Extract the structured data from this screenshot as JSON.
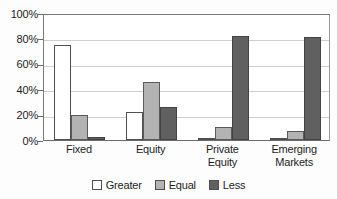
{
  "chart_data": {
    "type": "bar",
    "title": "",
    "subtitle": "",
    "xlabel": "",
    "ylabel": "",
    "categories": [
      "Fixed",
      "Equity",
      "Private Equity",
      "Emerging Markets"
    ],
    "category_lines": [
      [
        "Fixed"
      ],
      [
        "Equity"
      ],
      [
        "Private",
        "Equity"
      ],
      [
        "Emerging",
        "Markets"
      ]
    ],
    "series": [
      {
        "name": "Greater",
        "color": "#ffffff",
        "values": [
          75,
          22,
          1,
          1
        ]
      },
      {
        "name": "Equal",
        "color": "#b3b3b3",
        "values": [
          20,
          46,
          10,
          7
        ]
      },
      {
        "name": "Less",
        "color": "#606060",
        "values": [
          2,
          26,
          82,
          81
        ]
      }
    ],
    "ylim": [
      0,
      100
    ],
    "ytick_values": [
      0,
      20,
      40,
      60,
      80,
      100
    ],
    "ytick_labels": [
      "0%",
      "20%",
      "40%",
      "60%",
      "80%",
      "100%"
    ],
    "grid": true,
    "grid_axis": "y",
    "legend": true,
    "legend_position": "bottom"
  },
  "legend": {
    "items": [
      {
        "label": "Greater",
        "swatch": "legend-swatch-greater"
      },
      {
        "label": "Equal",
        "swatch": "legend-swatch-equal"
      },
      {
        "label": "Less",
        "swatch": "legend-swatch-less"
      }
    ]
  },
  "colors": {
    "greater": "#ffffff",
    "equal": "#b3b3b3",
    "less": "#606060",
    "axis": "#6b6b6b",
    "gridline": "#cfcfcf",
    "background": "#ffffff",
    "text": "#1c1c1c"
  }
}
